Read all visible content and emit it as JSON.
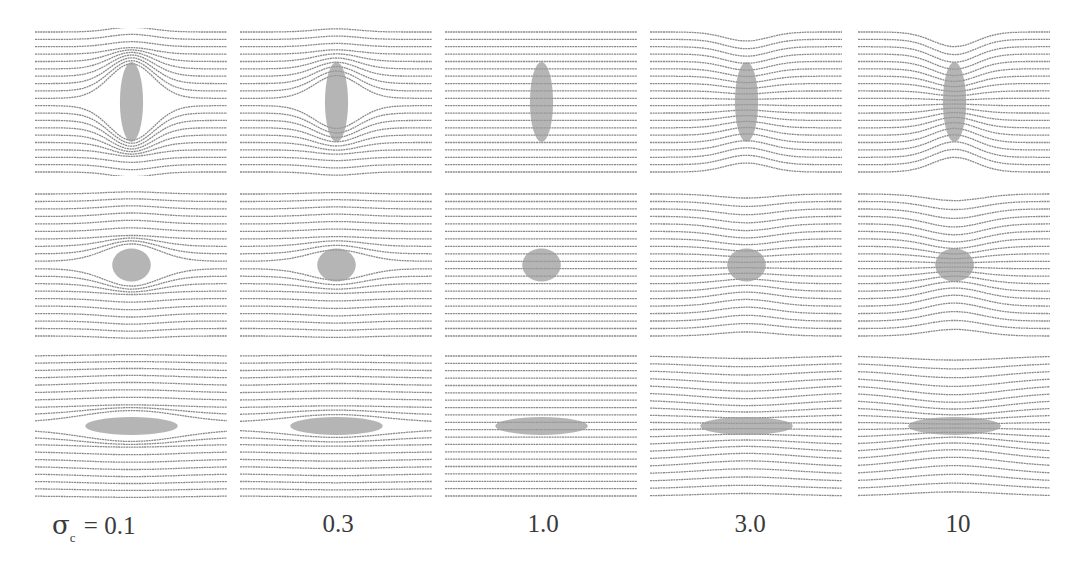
{
  "figure": {
    "colors": {
      "streamline": "#8a8a8a",
      "inclusion": "#9c9c9c",
      "background": "#ffffff"
    },
    "columns": [
      {
        "id": "c0",
        "sigma": 0.1,
        "label": "0.1",
        "label_prefix_symbol": "σ",
        "label_prefix_sub": "c",
        "label_prefix_eq": " = "
      },
      {
        "id": "c1",
        "sigma": 0.3,
        "label": "0.3"
      },
      {
        "id": "c2",
        "sigma": 1.0,
        "label": "1.0"
      },
      {
        "id": "c3",
        "sigma": 3.0,
        "label": "3.0"
      },
      {
        "id": "c4",
        "sigma": 10,
        "label": "10"
      }
    ],
    "rows": [
      {
        "id": "r0",
        "shape": "vertical-ellipse",
        "a": 0.06,
        "b": 0.27
      },
      {
        "id": "r1",
        "shape": "circle",
        "a": 0.1,
        "b": 0.11
      },
      {
        "id": "r2",
        "shape": "horizontal-ellipse",
        "a": 0.24,
        "b": 0.06
      }
    ],
    "panel_boxes": {
      "x": [
        35,
        240,
        445,
        650,
        858
      ],
      "y": [
        28,
        190,
        352
      ],
      "w": 193,
      "h": [
        148,
        150,
        148
      ]
    },
    "streamline_count": 20
  }
}
